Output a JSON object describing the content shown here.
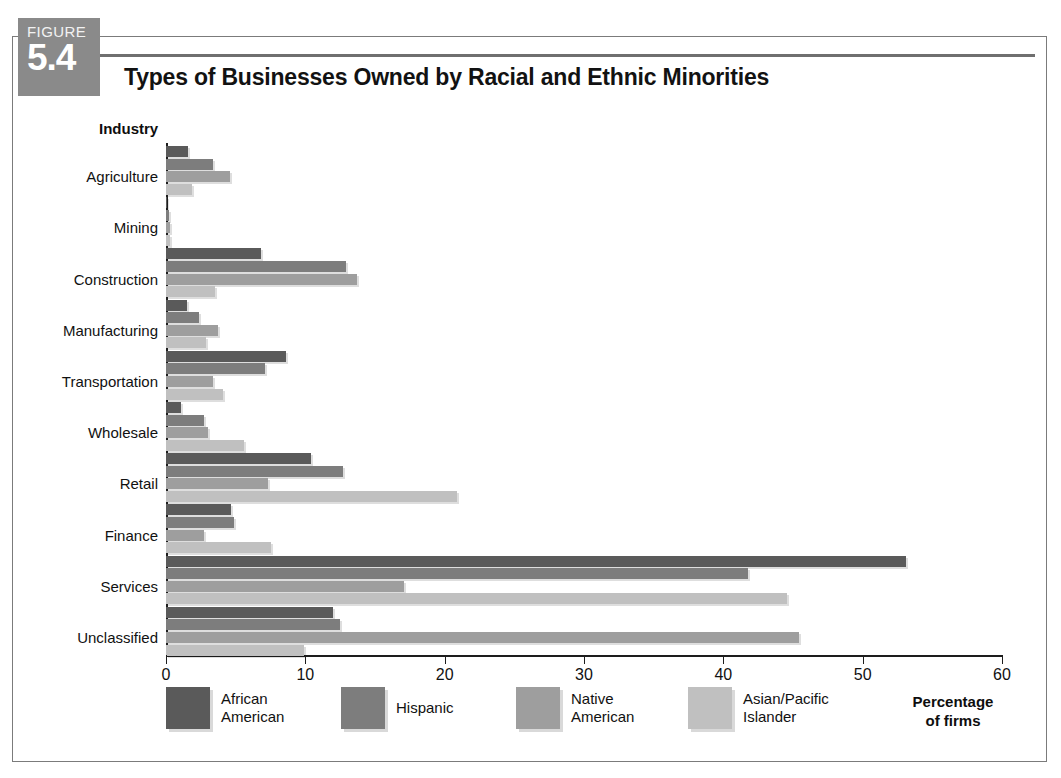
{
  "figure": {
    "word": "FIGURE",
    "number": "5.4"
  },
  "chart_data": {
    "type": "bar",
    "orientation": "horizontal",
    "title": "Types of Businesses Owned by Racial and Ethnic Minorities",
    "xlabel": "Percentage\nof firms",
    "ylabel": "Industry",
    "xlim": [
      0,
      60
    ],
    "xticks": [
      0,
      10,
      20,
      30,
      40,
      50,
      60
    ],
    "xtick_labels": [
      "0",
      "10",
      "20",
      "30",
      "40",
      "50",
      "60"
    ],
    "grid": false,
    "legend_position": "bottom",
    "categories": [
      "Agriculture",
      "Mining",
      "Construction",
      "Manufacturing",
      "Transportation",
      "Wholesale",
      "Retail",
      "Finance",
      "Services",
      "Unclassified"
    ],
    "series": [
      {
        "name": "African\nAmerican",
        "legend_label": "African American",
        "color": "#5a5a5a",
        "values": [
          1.6,
          0.1,
          6.8,
          1.5,
          8.6,
          1.1,
          10.4,
          4.7,
          53.1,
          12.0
        ]
      },
      {
        "name": "Hispanic",
        "legend_label": "Hispanic",
        "color": "#7d7d7d",
        "values": [
          3.4,
          0.2,
          12.9,
          2.4,
          7.1,
          2.7,
          12.7,
          4.9,
          41.8,
          12.5
        ]
      },
      {
        "name": "Native\nAmerican",
        "legend_label": "Native American",
        "color": "#9e9e9e",
        "values": [
          4.6,
          0.3,
          13.7,
          3.7,
          3.4,
          3.0,
          7.3,
          2.7,
          17.1,
          45.4
        ]
      },
      {
        "name": "Asian/Pacific\nIslander",
        "legend_label": "Asian/Pacific Islander",
        "color": "#c0c0c0",
        "values": [
          1.9,
          0.3,
          3.5,
          2.9,
          4.1,
          5.6,
          20.9,
          7.5,
          44.6,
          9.9
        ]
      }
    ]
  }
}
